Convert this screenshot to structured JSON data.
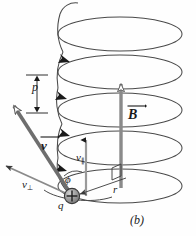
{
  "figure": {
    "caption": "(b)",
    "background_color": "#fefefe",
    "width": 196,
    "height": 236
  },
  "labels": {
    "magnetic_field": "B",
    "velocity": "v",
    "velocity_parallel_base": "v",
    "velocity_parallel_sub": "∥",
    "velocity_perpendicular_base": "v",
    "velocity_perpendicular_sub": "⊥",
    "pitch": "p",
    "radius": "r",
    "charge": "q",
    "angle": "ϕ"
  },
  "colors": {
    "helix_stroke": "#4a4a4a",
    "vector_gray": "#8a8a8a",
    "vector_gray_dark": "#6e6e6e",
    "arrowhead_black": "#1a1a1a",
    "charge_fill": "#9a9a9a",
    "charge_stroke": "#3a3a3a",
    "text": "#1a1a1a",
    "thin_line": "#6a6a6a"
  },
  "geometry": {
    "helix_center_x": 120,
    "helix_rx": 62,
    "helix_ry": 17,
    "loop_y_positions": [
      34,
      72,
      110,
      148,
      186
    ],
    "pitch_value_px": 38,
    "charge_position": {
      "x": 72,
      "y": 196
    },
    "b_arrow": {
      "x": 121,
      "y_tail": 186,
      "y_tip": 78
    },
    "v_arrow": {
      "x1": 72,
      "y1": 196,
      "x2": 12,
      "y2": 104
    },
    "v_perp_arrow": {
      "x1": 72,
      "y1": 196,
      "x2": 5,
      "y2": 166
    },
    "v_para_arrow": {
      "x": 86,
      "y_tail": 196,
      "y_tip": 140
    }
  },
  "annotations": {
    "direction_arrowheads_count": 4,
    "right_angle_marker": true,
    "pitch_dimension_arrow": "double-headed vertical"
  }
}
